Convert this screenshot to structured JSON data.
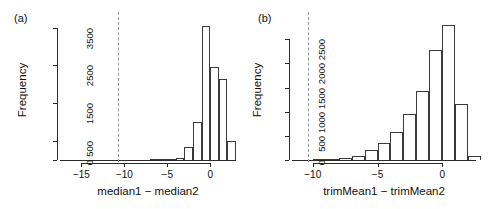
{
  "figure": {
    "background": "#ffffff",
    "bar_stroke": "#3a3a3a",
    "axis_color": "#2b2b2b",
    "vline_color": "#9a9a9a"
  },
  "panels": [
    {
      "id": "a",
      "label": "(a)"
    },
    {
      "id": "b",
      "label": "(b)"
    }
  ],
  "chart_data": [
    {
      "type": "bar",
      "subtype": "histogram",
      "panel": "(a)",
      "title": "",
      "xlabel": "median1 − median2",
      "ylabel": "Frequency",
      "xlim": [
        -17.5,
        3.0
      ],
      "ylim": [
        0,
        3700
      ],
      "xticks": [
        -15,
        -10,
        -5,
        0
      ],
      "xticklabels": [
        "−15",
        "−10",
        "−5",
        "0"
      ],
      "yticks": [
        0,
        500,
        1500,
        2500,
        3500
      ],
      "yticklabels": [
        "0",
        "500",
        "1500",
        "2500",
        "3500"
      ],
      "grid": false,
      "legend": null,
      "bin_width": 1,
      "bin_starts": [
        -7,
        -6,
        -5,
        -4,
        -3,
        -2,
        -1,
        0,
        1,
        2
      ],
      "values": [
        4,
        6,
        12,
        55,
        345,
        1000,
        3550,
        2450,
        2150,
        510
      ],
      "annotations": [
        {
          "type": "vline",
          "x": -10.7,
          "style": "dashed",
          "color": "#9a9a9a"
        }
      ]
    },
    {
      "type": "bar",
      "subtype": "histogram",
      "panel": "(b)",
      "title": "",
      "xlabel": "trimMean1 − trimMean2",
      "ylabel": "Frequency",
      "xlim": [
        -11.6,
        2.6
      ],
      "ylim": [
        0,
        2900
      ],
      "xticks": [
        -10,
        -5,
        0
      ],
      "xticklabels": [
        "−10",
        "−5",
        "0"
      ],
      "yticks": [
        0,
        500,
        1000,
        1500,
        2000,
        2500
      ],
      "yticklabels": [
        "0",
        "500",
        "1000",
        "1500",
        "2000",
        "2500"
      ],
      "grid": false,
      "legend": null,
      "bin_width": 1,
      "bin_starts": [
        -10,
        -9,
        -8,
        -7,
        -6,
        -5,
        -4,
        -3,
        -2,
        -1,
        0,
        1,
        2
      ],
      "values": [
        5,
        15,
        50,
        90,
        210,
        350,
        575,
        950,
        1430,
        2280,
        2800,
        1160,
        90
      ],
      "annotations": [
        {
          "type": "vline",
          "x": -10.35,
          "style": "dashed",
          "color": "#9a9a9a"
        }
      ]
    }
  ]
}
